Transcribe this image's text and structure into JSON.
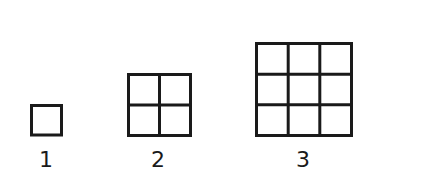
{
  "diagram": {
    "stroke_color": "#1a1a1a",
    "figures": [
      {
        "label": "1",
        "grid_size": 1,
        "squares": 1
      },
      {
        "label": "2",
        "grid_size": 2,
        "squares": 4
      },
      {
        "label": "3",
        "grid_size": 3,
        "squares": 9
      }
    ]
  }
}
